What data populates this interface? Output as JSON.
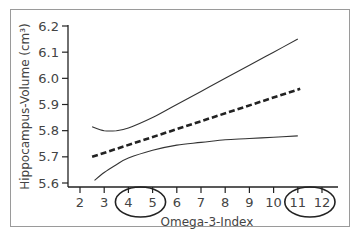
{
  "chart_data": {
    "type": "line",
    "title": "",
    "xlabel": "Omega-3-Index",
    "ylabel": "Hippocampus-Volume (cm³)",
    "xlim": [
      1.6,
      12.6
    ],
    "ylim": [
      5.6,
      6.2
    ],
    "x_ticks": [
      2,
      3,
      4,
      5,
      6,
      7,
      8,
      9,
      10,
      11,
      12
    ],
    "x_tick_labels": [
      "2",
      "3",
      "4",
      "5",
      "6",
      "7",
      "8",
      "9",
      "10",
      "11",
      "12"
    ],
    "y_ticks": [
      5.6,
      5.7,
      5.8,
      5.9,
      6.0,
      6.1,
      6.2
    ],
    "y_tick_labels": [
      "5.6",
      "5.7",
      "5.8",
      "5.9",
      "6.0",
      "6.1",
      "6.2"
    ],
    "grid": false,
    "series": [
      {
        "name": "regression-fit",
        "style": "dashed",
        "x": [
          2.5,
          11.1
        ],
        "y": [
          5.7,
          5.96
        ]
      },
      {
        "name": "upper-confidence-bound",
        "style": "solid",
        "x": [
          2.5,
          3.0,
          3.5,
          4.0,
          5.0,
          6.0,
          7.0,
          8.0,
          9.0,
          10.0,
          11.0
        ],
        "y": [
          5.815,
          5.8,
          5.8,
          5.81,
          5.85,
          5.9,
          5.95,
          6.0,
          6.05,
          6.1,
          6.15
        ]
      },
      {
        "name": "lower-confidence-bound",
        "style": "solid",
        "x": [
          2.6,
          3.0,
          3.5,
          4.0,
          5.0,
          6.0,
          7.0,
          8.0,
          9.0,
          10.0,
          11.0
        ],
        "y": [
          5.61,
          5.64,
          5.67,
          5.695,
          5.725,
          5.745,
          5.755,
          5.765,
          5.77,
          5.775,
          5.78
        ]
      }
    ],
    "annotations": [
      {
        "type": "ellipse",
        "label": "circled-range-4-5",
        "x_range": [
          4,
          5
        ]
      },
      {
        "type": "ellipse",
        "label": "circled-range-11-12",
        "x_range": [
          11,
          12
        ]
      }
    ]
  }
}
